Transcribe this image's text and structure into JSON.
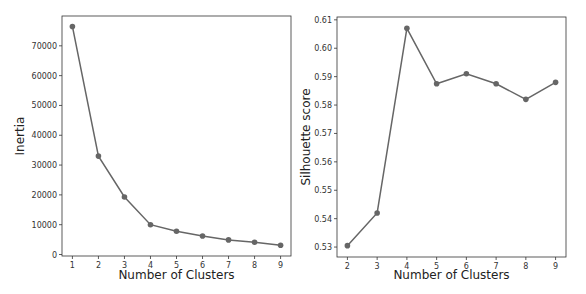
{
  "chart_data": [
    {
      "type": "line",
      "title": "",
      "xlabel": "Number of Clusters",
      "ylabel": "Inertia",
      "x": [
        1,
        2,
        3,
        4,
        5,
        6,
        7,
        8,
        9
      ],
      "values": [
        76500,
        33000,
        19300,
        10000,
        7800,
        6200,
        4900,
        4100,
        3100
      ],
      "xticks": [
        "1",
        "2",
        "3",
        "4",
        "5",
        "6",
        "7",
        "8",
        "9"
      ],
      "yticks": [
        "0",
        "10000",
        "20000",
        "30000",
        "40000",
        "50000",
        "60000",
        "70000"
      ],
      "ylim": [
        -500,
        80000
      ],
      "xlim": [
        0.6,
        9.4
      ],
      "grid": false,
      "marker": "circle",
      "color": "#666666"
    },
    {
      "type": "line",
      "title": "",
      "xlabel": "Number of Clusters",
      "ylabel": "Silhouette score",
      "x": [
        2,
        3,
        4,
        5,
        6,
        7,
        8,
        9
      ],
      "values": [
        0.5305,
        0.542,
        0.607,
        0.5875,
        0.591,
        0.5875,
        0.582,
        0.588
      ],
      "xticks": [
        "2",
        "3",
        "4",
        "5",
        "6",
        "7",
        "8",
        "9"
      ],
      "yticks": [
        "0.53",
        "0.54",
        "0.55",
        "0.56",
        "0.57",
        "0.58",
        "0.59",
        "0.60",
        "0.61"
      ],
      "ylim": [
        0.5265,
        0.611
      ],
      "xlim": [
        1.65,
        9.35
      ],
      "grid": false,
      "marker": "circle",
      "color": "#666666"
    }
  ]
}
